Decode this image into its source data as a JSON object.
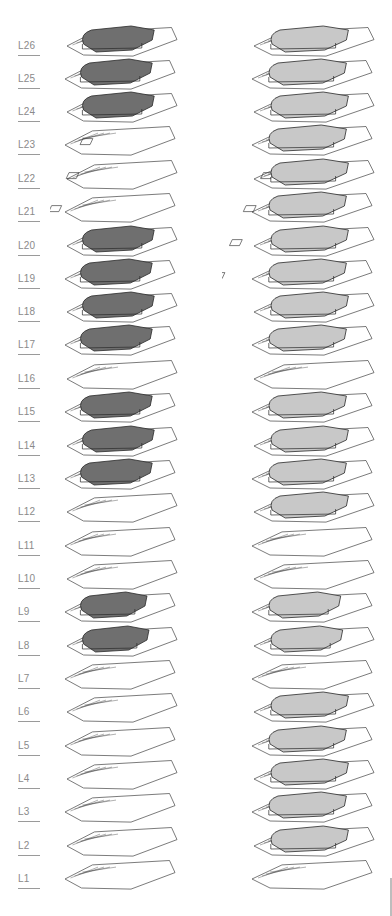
{
  "diagram": {
    "type": "exploded-axonometric-floor-stack",
    "columns": [
      {
        "id": "left",
        "fill_color": "#6f6f6f",
        "filled_levels": [
          "L26",
          "L25",
          "L24",
          "L20",
          "L19",
          "L18",
          "L17",
          "L15",
          "L14",
          "L13",
          "L9",
          "L8"
        ]
      },
      {
        "id": "right",
        "fill_color": "#c8c8c8",
        "filled_levels": [
          "L26",
          "L25",
          "L24",
          "L23",
          "L22",
          "L21",
          "L20",
          "L19",
          "L18",
          "L17",
          "L15",
          "L14",
          "L13",
          "L12",
          "L9",
          "L8",
          "L6",
          "L5",
          "L4",
          "L3",
          "L2"
        ]
      }
    ],
    "line_color": "#3a3a3a",
    "label_color": "#8a8a8a"
  },
  "levels": [
    {
      "label": "L26",
      "y": 46
    },
    {
      "label": "L25",
      "y": 79
    },
    {
      "label": "L24",
      "y": 112
    },
    {
      "label": "L23",
      "y": 145
    },
    {
      "label": "L22",
      "y": 179
    },
    {
      "label": "L21",
      "y": 212
    },
    {
      "label": "L20",
      "y": 246
    },
    {
      "label": "L19",
      "y": 279
    },
    {
      "label": "L18",
      "y": 312
    },
    {
      "label": "L17",
      "y": 345
    },
    {
      "label": "L16",
      "y": 379
    },
    {
      "label": "L15",
      "y": 412
    },
    {
      "label": "L14",
      "y": 446
    },
    {
      "label": "L13",
      "y": 479
    },
    {
      "label": "L12",
      "y": 512
    },
    {
      "label": "L11",
      "y": 546
    },
    {
      "label": "L10",
      "y": 579
    },
    {
      "label": "L9",
      "y": 612
    },
    {
      "label": "L8",
      "y": 646
    },
    {
      "label": "L7",
      "y": 679
    },
    {
      "label": "L6",
      "y": 712
    },
    {
      "label": "L5",
      "y": 746
    },
    {
      "label": "L4",
      "y": 779
    },
    {
      "label": "L3",
      "y": 812
    },
    {
      "label": "L2",
      "y": 846
    },
    {
      "label": "L1",
      "y": 879
    }
  ]
}
